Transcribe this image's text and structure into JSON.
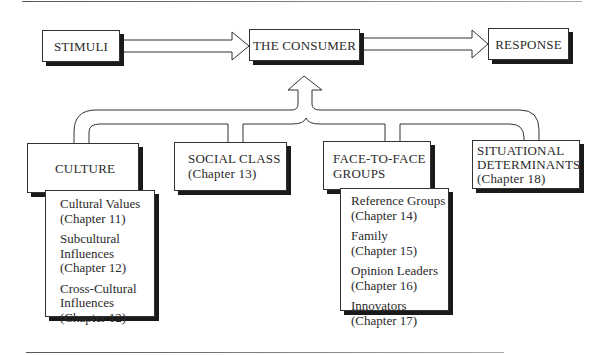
{
  "diagram": {
    "top_row": {
      "stimuli": "STIMULI",
      "consumer": "THE CONSUMER",
      "response": "RESPONSE"
    },
    "influences": [
      {
        "title_lines": [
          "CULTURE"
        ],
        "chapter": "",
        "sub_items": [
          {
            "lines": [
              "Cultural Values",
              "(Chapter 11)"
            ]
          },
          {
            "lines": [
              "Subcultural",
              "Influences",
              "(Chapter 12)"
            ]
          },
          {
            "lines": [
              "Cross-Cultural",
              "Influences",
              "(Chapter 12)"
            ]
          }
        ]
      },
      {
        "title_lines": [
          "SOCIAL CLASS"
        ],
        "chapter": "(Chapter 13)",
        "sub_items": []
      },
      {
        "title_lines": [
          "FACE-TO-FACE",
          "GROUPS"
        ],
        "chapter": "",
        "sub_items": [
          {
            "lines": [
              "Reference Groups",
              "(Chapter 14)"
            ]
          },
          {
            "lines": [
              "Family",
              "(Chapter 15)"
            ]
          },
          {
            "lines": [
              "Opinion Leaders",
              "(Chapter 16)"
            ]
          },
          {
            "lines": [
              "Innovators",
              "(Chapter 17)"
            ]
          }
        ]
      },
      {
        "title_lines": [
          "SITUATIONAL",
          "DETERMINANTS"
        ],
        "chapter": "(Chapter 18)",
        "sub_items": []
      }
    ],
    "colors": {
      "line": "#333333",
      "shadow": "#1a1a1a",
      "background": "#ffffff"
    }
  }
}
